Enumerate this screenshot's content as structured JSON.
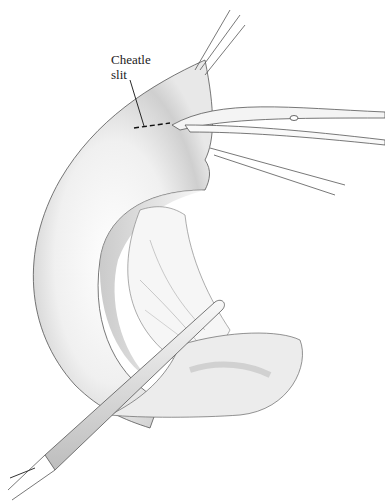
{
  "illustration": {
    "subject": "Surgical illustration of duodenal/intestinal segment held by forceps and scissors, with tube inserted",
    "labels": [
      {
        "id": "cheatle-slit",
        "line1": "Cheatle",
        "line2": "slit"
      }
    ],
    "colors": {
      "background": "#ffffff",
      "ink": "#2a2a2a",
      "shade_dark": "#9a9a9a",
      "shade_light": "#e6e6e6"
    }
  }
}
